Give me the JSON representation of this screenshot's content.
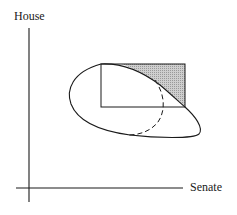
{
  "diagram": {
    "type": "win-set diagram",
    "axes": {
      "x_label": "Senate",
      "y_label": "House"
    },
    "elements": [
      {
        "name": "preference-loop",
        "style": "solid closed curve"
      },
      {
        "name": "status-quo-rectangle",
        "style": "solid rectangle"
      },
      {
        "name": "shaded-region",
        "style": "hatched grey triangle in upper-right of rectangle"
      },
      {
        "name": "dashed-arc",
        "style": "dashed curve"
      }
    ]
  },
  "colors": {
    "ink": "#1a1a1a",
    "shade": "#b8b8b8",
    "background": "#ffffff"
  }
}
